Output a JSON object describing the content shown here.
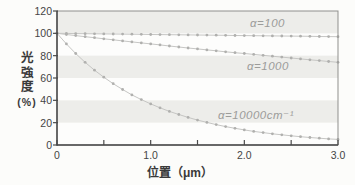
{
  "figure": {
    "ylabel_chars": [
      "光",
      "強",
      "度"
    ],
    "ylabel_unit": "(%)",
    "xlabel": "位置（μm）"
  },
  "chart_data": {
    "type": "line",
    "title": "",
    "xlabel": "位置（μm）",
    "ylabel": "光強度（%）",
    "xlim": [
      0,
      3.0
    ],
    "ylim": [
      0,
      120
    ],
    "grid": false,
    "legend_position": "in-plot-annotations",
    "x_major_ticks": [
      0,
      1.0,
      2.0,
      3.0
    ],
    "x_major_tick_labels": [
      "0",
      "1.0",
      "2.0",
      "3.0"
    ],
    "x_minor_ticks": [
      0.5,
      1.5,
      2.5
    ],
    "y_ticks": [
      0,
      20,
      40,
      60,
      80,
      100,
      120
    ],
    "y_tick_labels": [
      "0",
      "20",
      "40",
      "60",
      "80",
      "100",
      "120"
    ],
    "shaded_bands_y": [
      [
        100,
        120
      ],
      [
        60,
        80
      ],
      [
        20,
        40
      ]
    ],
    "x": [
      0,
      0.1,
      0.2,
      0.3,
      0.4,
      0.5,
      0.6,
      0.7,
      0.8,
      0.9,
      1.0,
      1.1,
      1.2,
      1.3,
      1.4,
      1.5,
      1.6,
      1.7,
      1.8,
      1.9,
      2.0,
      2.1,
      2.2,
      2.3,
      2.4,
      2.5,
      2.6,
      2.7,
      2.8,
      2.9,
      3.0
    ],
    "series": [
      {
        "id": "alpha-100",
        "label": "α=100",
        "values": [
          100,
          99.9,
          99.8,
          99.7,
          99.6,
          99.5,
          99.4,
          99.3,
          99.2,
          99.1,
          99.0,
          98.9,
          98.8,
          98.7,
          98.6,
          98.5,
          98.4,
          98.3,
          98.2,
          98.1,
          98.0,
          97.9,
          97.8,
          97.7,
          97.6,
          97.5,
          97.4,
          97.3,
          97.2,
          97.1,
          97.0
        ]
      },
      {
        "id": "alpha-1000",
        "label": "α=1000",
        "values": [
          100,
          99.0,
          98.0,
          97.0,
          96.1,
          95.1,
          94.2,
          93.2,
          92.3,
          91.4,
          90.5,
          89.6,
          88.7,
          87.8,
          86.9,
          86.1,
          85.2,
          84.4,
          83.5,
          82.7,
          81.9,
          81.1,
          80.3,
          79.5,
          78.7,
          77.9,
          77.1,
          76.3,
          75.6,
          74.8,
          74.1
        ]
      },
      {
        "id": "alpha-10000",
        "label": "α=10000cm⁻¹",
        "values": [
          100,
          90.5,
          81.9,
          74.1,
          67.0,
          60.7,
          54.9,
          49.7,
          44.9,
          40.7,
          36.8,
          33.3,
          30.1,
          27.3,
          24.7,
          22.3,
          20.2,
          18.3,
          16.5,
          15.0,
          13.5,
          12.2,
          11.1,
          10.0,
          9.1,
          8.2,
          7.4,
          6.7,
          6.1,
          5.5,
          5.0
        ]
      }
    ],
    "colors": {
      "plot_background": "#fdfdfc",
      "band": "#ededea",
      "axis": "#4a4a4a",
      "border": "#8f8f8d",
      "curve": "#c6c6c4",
      "marker": "#b0b0ae",
      "series_label": "#9c9c9a",
      "tick_text": "#454545"
    }
  }
}
